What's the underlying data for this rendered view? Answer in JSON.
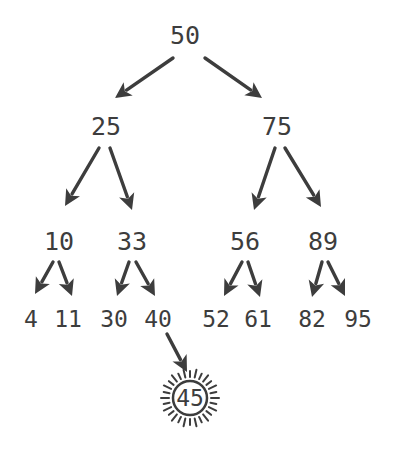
{
  "diagram": {
    "type": "binary-search-tree",
    "colors": {
      "ink": "#3d3d3d",
      "background": "#ffffff"
    },
    "nodes": [
      {
        "id": "n50",
        "label": "50",
        "x": 185,
        "y": 35,
        "size": "big"
      },
      {
        "id": "n25",
        "label": "25",
        "x": 106,
        "y": 126,
        "size": "big"
      },
      {
        "id": "n75",
        "label": "75",
        "x": 277,
        "y": 126,
        "size": "big"
      },
      {
        "id": "n10",
        "label": "10",
        "x": 59,
        "y": 241,
        "size": "big"
      },
      {
        "id": "n33",
        "label": "33",
        "x": 132,
        "y": 241,
        "size": "big"
      },
      {
        "id": "n56",
        "label": "56",
        "x": 245,
        "y": 241,
        "size": "big"
      },
      {
        "id": "n89",
        "label": "89",
        "x": 323,
        "y": 241,
        "size": "big"
      },
      {
        "id": "n4",
        "label": "4",
        "x": 31,
        "y": 318,
        "size": "small"
      },
      {
        "id": "n11",
        "label": "11",
        "x": 68,
        "y": 318,
        "size": "small"
      },
      {
        "id": "n30",
        "label": "30",
        "x": 114,
        "y": 318,
        "size": "small"
      },
      {
        "id": "n40",
        "label": "40",
        "x": 158,
        "y": 318,
        "size": "small"
      },
      {
        "id": "n52",
        "label": "52",
        "x": 216,
        "y": 318,
        "size": "small"
      },
      {
        "id": "n61",
        "label": "61",
        "x": 258,
        "y": 318,
        "size": "small"
      },
      {
        "id": "n82",
        "label": "82",
        "x": 312,
        "y": 318,
        "size": "small"
      },
      {
        "id": "n95",
        "label": "95",
        "x": 358,
        "y": 318,
        "size": "small"
      }
    ],
    "highlight": {
      "id": "n45",
      "label": "45",
      "x": 190,
      "y": 398,
      "style": "sunburst-circle"
    },
    "edges": [
      {
        "from": "n50",
        "to": "n25",
        "x1": 173,
        "y1": 58,
        "x2": 115,
        "y2": 98
      },
      {
        "from": "n50",
        "to": "n75",
        "x1": 205,
        "y1": 58,
        "x2": 262,
        "y2": 98
      },
      {
        "from": "n25",
        "to": "n10",
        "x1": 99,
        "y1": 148,
        "x2": 65,
        "y2": 206
      },
      {
        "from": "n25",
        "to": "n33",
        "x1": 110,
        "y1": 148,
        "x2": 132,
        "y2": 210
      },
      {
        "from": "n75",
        "to": "n56",
        "x1": 275,
        "y1": 148,
        "x2": 254,
        "y2": 210
      },
      {
        "from": "n75",
        "to": "n89",
        "x1": 285,
        "y1": 148,
        "x2": 321,
        "y2": 207
      },
      {
        "from": "n10",
        "to": "n4",
        "x1": 53,
        "y1": 262,
        "x2": 35,
        "y2": 294
      },
      {
        "from": "n10",
        "to": "n11",
        "x1": 59,
        "y1": 262,
        "x2": 72,
        "y2": 296
      },
      {
        "from": "n33",
        "to": "n30",
        "x1": 129,
        "y1": 262,
        "x2": 117,
        "y2": 296
      },
      {
        "from": "n33",
        "to": "n40",
        "x1": 136,
        "y1": 262,
        "x2": 155,
        "y2": 296
      },
      {
        "from": "n56",
        "to": "n52",
        "x1": 242,
        "y1": 262,
        "x2": 224,
        "y2": 296
      },
      {
        "from": "n56",
        "to": "n61",
        "x1": 248,
        "y1": 262,
        "x2": 260,
        "y2": 297
      },
      {
        "from": "n89",
        "to": "n82",
        "x1": 322,
        "y1": 262,
        "x2": 312,
        "y2": 297
      },
      {
        "from": "n89",
        "to": "n95",
        "x1": 328,
        "y1": 262,
        "x2": 345,
        "y2": 296
      },
      {
        "from": "n40",
        "to": "n45",
        "x1": 167,
        "y1": 334,
        "x2": 187,
        "y2": 372
      }
    ]
  }
}
